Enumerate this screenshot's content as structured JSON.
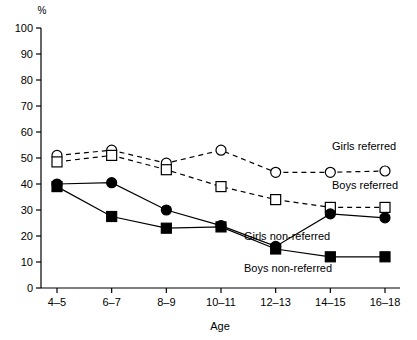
{
  "chart_data": {
    "type": "line",
    "title": "",
    "xlabel": "Age",
    "ylabel": "%",
    "categories": [
      "4–5",
      "6–7",
      "8–9",
      "10–11",
      "12–13",
      "14–15",
      "16–18"
    ],
    "ylim": [
      0,
      100
    ],
    "ytick_labels": [
      "0",
      "10",
      "20",
      "30",
      "40",
      "50",
      "60",
      "70",
      "80",
      "90",
      "100"
    ],
    "ytick_values": [
      0,
      10,
      20,
      30,
      40,
      50,
      60,
      70,
      80,
      90,
      100
    ],
    "grid": false,
    "legend_position": "inline-right-annotations",
    "series": [
      {
        "name": "Girls referred",
        "values": [
          51,
          53,
          48,
          53,
          44.5,
          44.5,
          45
        ],
        "marker": "open-circle",
        "line_style": "dashed",
        "color": "#000000",
        "annotation": "Girls referred"
      },
      {
        "name": "Boys referred",
        "values": [
          48.5,
          51,
          45.5,
          39,
          34,
          31,
          31
        ],
        "marker": "open-square",
        "line_style": "dashed",
        "color": "#000000",
        "annotation": "Boys referred"
      },
      {
        "name": "Girls non-referred",
        "values": [
          40,
          40.5,
          30,
          24,
          16,
          28.5,
          27
        ],
        "marker": "filled-circle",
        "line_style": "solid",
        "color": "#000000",
        "annotation": "Girls non-referred"
      },
      {
        "name": "Boys non-referred",
        "values": [
          39,
          27.5,
          23,
          23.5,
          15,
          12,
          12
        ],
        "marker": "filled-square",
        "line_style": "solid",
        "color": "#000000",
        "annotation": "Boys non-referred"
      }
    ],
    "annotations": [
      {
        "text": "Girls referred",
        "x": 332,
        "y": 150
      },
      {
        "text": "Boys referred",
        "x": 332,
        "y": 189
      },
      {
        "text": "Girls non-referred",
        "x": 244,
        "y": 240
      },
      {
        "text": "Boys non-referred",
        "x": 244,
        "y": 272
      }
    ]
  },
  "axes": {
    "y_unit": "%",
    "x_title": "Age"
  }
}
